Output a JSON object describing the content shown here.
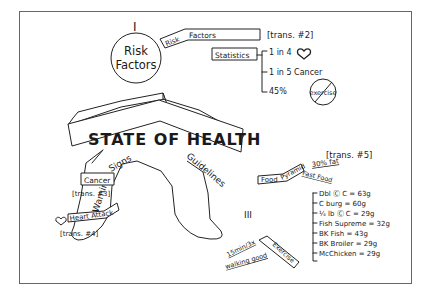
{
  "title": "STATE OF HEALTH",
  "head": {
    "roman": "I",
    "label_line1": "Risk",
    "label_line2": "Factors"
  },
  "risk_factors_tag": {
    "label_a": "Risk",
    "label_b": "Factors",
    "trans": "[trans. #2]"
  },
  "statistics": {
    "label": "Statistics",
    "items": [
      {
        "text": "1 in 4",
        "icon": "heart-icon"
      },
      {
        "text": "1 in 5 Cancer"
      },
      {
        "text": "45%",
        "icon": "no-exercise-icon",
        "icon_text": "exercise"
      }
    ]
  },
  "warning_signs": {
    "roman": "II",
    "label_a": "Warning",
    "label_b": "Signs",
    "cancer": {
      "label": "Cancer",
      "trans": "[trans. #3]"
    },
    "heart_attack": {
      "label": "Heart Attack",
      "trans": "[trans. #4]",
      "icon": "heart-icon"
    }
  },
  "guidelines": {
    "roman": "III",
    "label": "Guidelines",
    "food_pyramid": {
      "label_a": "Food",
      "label_b": "Pyramid",
      "trans": "[trans. #5]",
      "fat": "30% fat"
    },
    "fast_food": {
      "label": "Fast Food",
      "items": [
        "Dbl Ⓒ C = 63g",
        "C burg = 60g",
        "¼ lb Ⓒ C = 29g",
        "Fish Supreme = 32g",
        "BK Fish = 43g",
        "BK Broiler = 29g",
        "McChicken = 29g"
      ]
    },
    "exercise": {
      "label": "Exercise",
      "note1": "15min/3x",
      "note2": "walking good"
    }
  }
}
